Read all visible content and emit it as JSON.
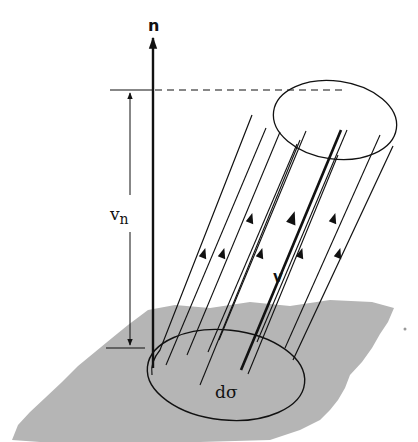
{
  "diagram": {
    "labels": {
      "normal": "n",
      "normal_component_v": "v",
      "normal_component_sub": "n",
      "velocity": "v",
      "area_element": "dσ"
    },
    "colors": {
      "surface_fill": "#b5b5b5",
      "line": "#111111",
      "background": "#ffffff"
    },
    "elements": [
      {
        "name": "surface",
        "type": "irregular gray plane"
      },
      {
        "name": "normal-vector",
        "label": "n",
        "direction": "up"
      },
      {
        "name": "normal-component-dimension",
        "label": "v_n"
      },
      {
        "name": "flux-cylinder",
        "description": "oblique cylinder of streamlines"
      },
      {
        "name": "area-element",
        "label": "dσ",
        "shape": "ellipse"
      },
      {
        "name": "velocity-vector",
        "label": "v",
        "style": "bold"
      },
      {
        "name": "streamlines",
        "count": 8,
        "arrows": 8
      }
    ]
  }
}
